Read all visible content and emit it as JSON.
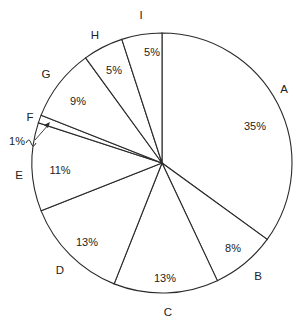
{
  "chart_data": {
    "type": "pie",
    "title": "",
    "start_angle": "12 o'clock",
    "direction": "clockwise",
    "categories": [
      "A",
      "B",
      "C",
      "D",
      "E",
      "F",
      "G",
      "H",
      "I"
    ],
    "values": [
      35,
      8,
      13,
      13,
      11,
      1,
      9,
      5,
      5
    ],
    "value_labels": [
      "35%",
      "8%",
      "13%",
      "13%",
      "11%",
      "1%",
      "9%",
      "5%",
      "5%"
    ],
    "fill_color": "#ffffff",
    "stroke_color": "#2a2a2a",
    "annotations": [
      {
        "text": "1%",
        "target": "F",
        "note": "callout with squiggle and arrow, placed outside circle"
      }
    ],
    "layout": {
      "cx": 162,
      "cy": 163,
      "r": 130,
      "category_label_positions": [
        {
          "label": "A",
          "x": 284,
          "y": 93
        },
        {
          "label": "B",
          "x": 258,
          "y": 280
        },
        {
          "label": "C",
          "x": 168,
          "y": 316
        },
        {
          "label": "D",
          "x": 60,
          "y": 274
        },
        {
          "label": "E",
          "x": 19,
          "y": 179
        },
        {
          "label": "F",
          "x": 30,
          "y": 121
        },
        {
          "label": "G",
          "x": 46,
          "y": 78
        },
        {
          "label": "H",
          "x": 95,
          "y": 39
        },
        {
          "label": "I",
          "x": 141,
          "y": 19
        }
      ],
      "value_label_positions": [
        {
          "label": "35%",
          "x": 255,
          "y": 130
        },
        {
          "label": "8%",
          "x": 233,
          "y": 252
        },
        {
          "label": "13%",
          "x": 165,
          "y": 282
        },
        {
          "label": "13%",
          "x": 87,
          "y": 246
        },
        {
          "label": "11%",
          "x": 60,
          "y": 174
        },
        {
          "label": "1%",
          "x": 17,
          "y": 145
        },
        {
          "label": "9%",
          "x": 78,
          "y": 105
        },
        {
          "label": "5%",
          "x": 114,
          "y": 74
        },
        {
          "label": "5%",
          "x": 152,
          "y": 56
        }
      ]
    }
  }
}
